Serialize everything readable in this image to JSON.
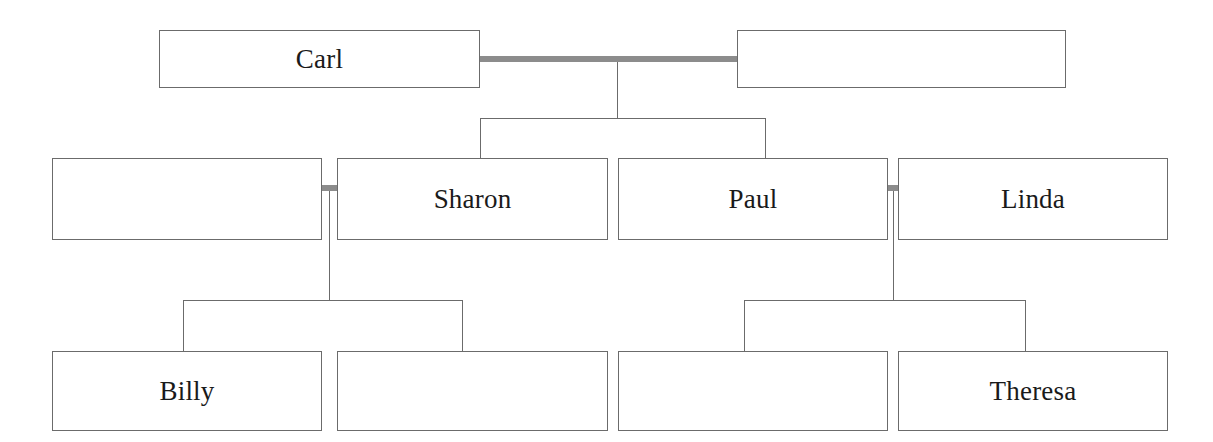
{
  "diagram": {
    "type": "family-tree",
    "background_color": "#ffffff",
    "box_border_color": "#6b6b6b",
    "marriage_line_color": "#8c8c8c",
    "child_line_color": "#6b6b6b",
    "text_color": "#1a1a1a"
  },
  "generations": [
    {
      "id": "generation-1",
      "boxes": [
        {
          "id": "g1-p1",
          "name": "Carl",
          "label": "Carl",
          "filled": true,
          "x": 159,
          "y": 30,
          "w": 321,
          "h": 58
        },
        {
          "id": "g1-p2",
          "name": "",
          "label": "",
          "filled": false,
          "x": 737,
          "y": 30,
          "w": 329,
          "h": 58
        }
      ]
    },
    {
      "id": "generation-2",
      "boxes": [
        {
          "id": "g2-p1",
          "name": "",
          "label": "",
          "filled": false,
          "x": 52,
          "y": 158,
          "w": 270,
          "h": 82
        },
        {
          "id": "g2-p2",
          "name": "Sharon",
          "label": "Sharon",
          "filled": true,
          "x": 337,
          "y": 158,
          "w": 271,
          "h": 82
        },
        {
          "id": "g2-p3",
          "name": "Paul",
          "label": "Paul",
          "filled": true,
          "x": 618,
          "y": 158,
          "w": 270,
          "h": 82
        },
        {
          "id": "g2-p4",
          "name": "Linda",
          "label": "Linda",
          "filled": true,
          "x": 898,
          "y": 158,
          "w": 270,
          "h": 82
        }
      ]
    },
    {
      "id": "generation-3",
      "boxes": [
        {
          "id": "g3-p1",
          "name": "Billy",
          "label": "Billy",
          "filled": true,
          "x": 52,
          "y": 351,
          "w": 270,
          "h": 80
        },
        {
          "id": "g3-p2",
          "name": "",
          "label": "",
          "filled": false,
          "x": 337,
          "y": 351,
          "w": 271,
          "h": 80
        },
        {
          "id": "g3-p3",
          "name": "",
          "label": "",
          "filled": false,
          "x": 618,
          "y": 351,
          "w": 270,
          "h": 80
        },
        {
          "id": "g3-p4",
          "name": "Theresa",
          "label": "Theresa",
          "filled": true,
          "x": 898,
          "y": 351,
          "w": 270,
          "h": 80
        }
      ]
    }
  ],
  "marriages": [
    {
      "id": "marriage-1",
      "spouses": [
        "Carl",
        ""
      ],
      "x": 480,
      "y": 56,
      "w": 257,
      "h": 6,
      "children_drop_x": 617
    },
    {
      "id": "marriage-2",
      "spouses": [
        "",
        "Sharon"
      ],
      "x": 322,
      "y": 185,
      "w": 15,
      "h": 6,
      "children_drop_x": 329
    },
    {
      "id": "marriage-3",
      "spouses": [
        "Paul",
        "Linda"
      ],
      "x": 887,
      "y": 185,
      "w": 12,
      "h": 6,
      "children_drop_x": 893
    }
  ],
  "connectors": [
    {
      "id": "drop-m1",
      "kind": "vertical",
      "x": 617,
      "y1": 59,
      "y2": 118
    },
    {
      "id": "sibling-bar-1",
      "kind": "horizontal",
      "y": 118,
      "x1": 480,
      "x2": 765
    },
    {
      "id": "stub-sharon",
      "kind": "vertical",
      "x": 480,
      "y1": 118,
      "y2": 158
    },
    {
      "id": "stub-paul",
      "kind": "vertical",
      "x": 765,
      "y1": 118,
      "y2": 158
    },
    {
      "id": "drop-m2",
      "kind": "vertical",
      "x": 329,
      "y1": 188,
      "y2": 300
    },
    {
      "id": "sibling-bar-2",
      "kind": "horizontal",
      "y": 300,
      "x1": 183,
      "x2": 462
    },
    {
      "id": "stub-billy",
      "kind": "vertical",
      "x": 183,
      "y1": 300,
      "y2": 351
    },
    {
      "id": "stub-g3p2",
      "kind": "vertical",
      "x": 462,
      "y1": 300,
      "y2": 351
    },
    {
      "id": "drop-m3",
      "kind": "vertical",
      "x": 893,
      "y1": 188,
      "y2": 300
    },
    {
      "id": "sibling-bar-3",
      "kind": "horizontal",
      "y": 300,
      "x1": 744,
      "x2": 1025
    },
    {
      "id": "stub-g3p3",
      "kind": "vertical",
      "x": 744,
      "y1": 300,
      "y2": 351
    },
    {
      "id": "stub-theresa",
      "kind": "vertical",
      "x": 1025,
      "y1": 300,
      "y2": 351
    }
  ]
}
